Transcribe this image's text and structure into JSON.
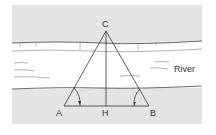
{
  "diagram": {
    "title": "",
    "labels": {
      "apex": "C",
      "left_base": "A",
      "foot": "H",
      "right_base": "B",
      "river": "River"
    },
    "colors": {
      "bank_fill": "#e4e4e4",
      "water_fill": "#ffffff",
      "line": "#333333"
    }
  }
}
